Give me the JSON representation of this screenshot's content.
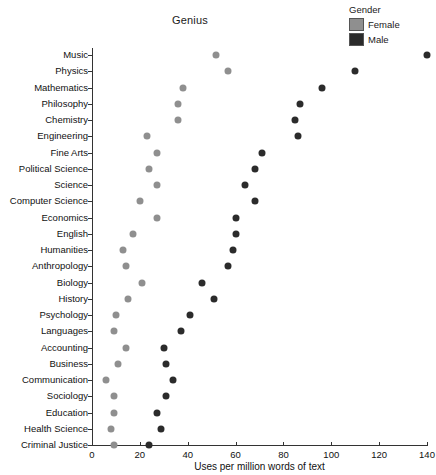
{
  "chart_data": {
    "type": "scatter",
    "title": "Genius",
    "xlabel": "Uses per million words of text",
    "ylabel": "",
    "xlim": [
      0,
      140
    ],
    "ylim_categories_count": 25,
    "grid": false,
    "legend_position": "top-right",
    "legend_title": "Gender",
    "xticks": [
      0,
      20,
      40,
      60,
      80,
      100,
      120,
      140
    ],
    "xticklabels": [
      "0",
      "20",
      "40",
      "60",
      "80",
      "100",
      "120",
      "140"
    ],
    "categories": [
      "Music",
      "Physics",
      "Mathematics",
      "Philosophy",
      "Chemistry",
      "Engineering",
      "Fine Arts",
      "Political Science",
      "Science",
      "Computer Science",
      "Economics",
      "English",
      "Humanities",
      "Anthropology",
      "Biology",
      "History",
      "Psychology",
      "Languages",
      "Accounting",
      "Business",
      "Communication",
      "Sociology",
      "Education",
      "Health Science",
      "Criminal Justice"
    ],
    "series": [
      {
        "name": "Female",
        "color": "#8f8f8f",
        "values": [
          52,
          57,
          38,
          36,
          36,
          23,
          27,
          24,
          27,
          20,
          27,
          17,
          13,
          14,
          21,
          15,
          10,
          9,
          14,
          11,
          6,
          9,
          9,
          8,
          9
        ]
      },
      {
        "name": "Male",
        "color": "#2b2b2b",
        "values": [
          140,
          110,
          96,
          87,
          85,
          86,
          71,
          68,
          64,
          68,
          60,
          60,
          59,
          57,
          46,
          51,
          41,
          37,
          30,
          31,
          34,
          31,
          27,
          29,
          24
        ]
      }
    ]
  },
  "legend": {
    "title": "Gender",
    "items": [
      {
        "label": "Female",
        "color": "#8f8f8f"
      },
      {
        "label": "Male",
        "color": "#2b2b2b"
      }
    ]
  }
}
